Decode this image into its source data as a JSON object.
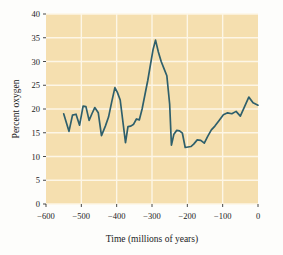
{
  "chart_data": {
    "type": "line",
    "title": "",
    "subtitle": "",
    "xlabel": "Time (millions of years)",
    "ylabel": "Percent oxygen",
    "xlim": [
      -600,
      0
    ],
    "ylim": [
      0,
      40
    ],
    "xticks": [
      -600,
      -500,
      -400,
      -300,
      -200,
      -100,
      0
    ],
    "xtick_labels": [
      "−600",
      "−500",
      "−400",
      "−300",
      "−200",
      "−100",
      "0"
    ],
    "yticks": [
      0,
      5,
      10,
      15,
      20,
      25,
      30,
      35,
      40
    ],
    "ytick_labels": [
      "0",
      "5",
      "10",
      "15",
      "20",
      "25",
      "30",
      "35",
      "40"
    ],
    "grid": true,
    "grid_color": "#fdf6e6",
    "plot_bgcolor": "#f5dfaf",
    "line_color": "#2e5f6b",
    "legend": null,
    "legend_position": "none",
    "series": [
      {
        "name": "Atmospheric oxygen",
        "x": [
          -550,
          -535,
          -525,
          -515,
          -505,
          -495,
          -487,
          -478,
          -470,
          -462,
          -452,
          -443,
          -432,
          -423,
          -414,
          -405,
          -398,
          -390,
          -382,
          -375,
          -368,
          -360,
          -352,
          -344,
          -336,
          -328,
          -320,
          -312,
          -304,
          -297,
          -290,
          -282,
          -274,
          -266,
          -258,
          -250,
          -245,
          -238,
          -230,
          -222,
          -214,
          -206,
          -198,
          -190,
          -182,
          -172,
          -162,
          -152,
          -142,
          -132,
          -122,
          -110,
          -98,
          -86,
          -74,
          -62,
          -50,
          -38,
          -26,
          -14,
          0
        ],
        "y": [
          19.0,
          15.3,
          18.7,
          18.9,
          16.6,
          20.6,
          20.5,
          17.6,
          19.0,
          20.3,
          19.2,
          14.4,
          16.4,
          18.3,
          21.5,
          24.5,
          23.5,
          21.9,
          17.1,
          12.9,
          16.3,
          16.4,
          16.8,
          17.9,
          17.7,
          20.0,
          23.0,
          26.0,
          29.5,
          32.5,
          34.5,
          32.0,
          30.0,
          28.5,
          27.0,
          21.0,
          12.4,
          14.7,
          15.5,
          15.4,
          14.9,
          11.9,
          12.0,
          12.1,
          12.6,
          13.5,
          13.4,
          12.8,
          14.3,
          15.6,
          16.4,
          17.6,
          18.8,
          19.2,
          19.0,
          19.5,
          18.5,
          20.5,
          22.5,
          21.3,
          20.8
        ]
      }
    ]
  },
  "axes": {
    "ylabel_text": "Percent oxygen",
    "xlabel_text": "Time (millions of years)"
  }
}
